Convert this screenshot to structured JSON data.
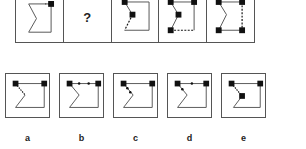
{
  "puzzle": {
    "question_mark": "?",
    "sequence_cells": 5,
    "missing_index": 1
  },
  "options": [
    {
      "label": "a"
    },
    {
      "label": "b"
    },
    {
      "label": "c"
    },
    {
      "label": "d"
    },
    {
      "label": "e"
    }
  ],
  "colors": {
    "line": "#555555",
    "marker": "#111111",
    "background": "#ffffff"
  }
}
